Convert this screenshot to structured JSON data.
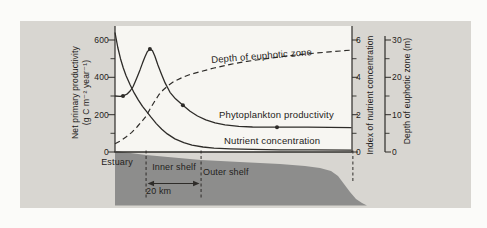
{
  "colors": {
    "paper": "#d8d6d1",
    "plot_bg": "#f7f6f2",
    "ink": "#2e2c29",
    "landmass": "#8d8d8c",
    "page": "#fbfbf9"
  },
  "figure": {
    "left_axis": {
      "title_line1": "Net primary productivity",
      "title_line2": "(g C m⁻² year⁻¹)",
      "ticks": [
        "0",
        "200",
        "400",
        "600"
      ]
    },
    "nutrient_axis": {
      "title": "Index of nutrient concentration",
      "ticks": [
        "0",
        "2",
        "4",
        "6"
      ]
    },
    "depth_axis": {
      "title": "Depth of euphotic zone (m)",
      "ticks": [
        "0",
        "10",
        "20",
        "30"
      ]
    },
    "curve_labels": {
      "depth": "Depth of euphotic zone",
      "phytoplankton": "Phytoplankton productivity",
      "nutrient": "Nutrient concentration"
    },
    "zones": {
      "estuary": "Estuary",
      "inner_shelf": "Inner shelf",
      "outer_shelf": "Outer shelf",
      "scale_bar": "20 km"
    }
  },
  "chart_data": {
    "type": "line",
    "title": "",
    "xlabel": "",
    "x_unit": "km offshore (scale bar = 20 km; zone boundaries marked by dashed lines)",
    "x_range_km": [
      0,
      86.5
    ],
    "axes": {
      "left": {
        "label": "Net primary productivity (g C m⁻² year⁻¹)",
        "range": [
          0,
          620
        ],
        "ticks": [
          0,
          200,
          400,
          600
        ],
        "minor_ticks": [
          100,
          300,
          500
        ]
      },
      "nutrient": {
        "label": "Index of nutrient concentration",
        "range": [
          0,
          6.6
        ],
        "ticks": [
          0,
          2,
          4,
          6
        ],
        "minor_ticks": [
          1,
          3,
          5
        ]
      },
      "depth": {
        "label": "Depth of euphotic zone (m)",
        "range": [
          0,
          32
        ],
        "ticks": [
          0,
          10,
          20,
          30
        ],
        "minor_ticks": [
          5,
          15,
          25
        ]
      }
    },
    "series": [
      {
        "name": "Phytoplankton productivity",
        "axis": "left",
        "style": "solid",
        "points": [
          [
            0,
            300
          ],
          [
            1.8,
            298
          ],
          [
            2.9,
            300
          ],
          [
            4.5,
            312
          ],
          [
            5.5,
            327
          ],
          [
            6.5,
            348
          ],
          [
            7.3,
            375
          ],
          [
            8.2,
            407
          ],
          [
            9.1,
            440
          ],
          [
            10,
            476
          ],
          [
            10.9,
            510
          ],
          [
            11.8,
            538
          ],
          [
            12.7,
            552
          ],
          [
            13.6,
            543
          ],
          [
            14.5,
            513
          ],
          [
            15.6,
            466
          ],
          [
            16.9,
            417
          ],
          [
            18.2,
            370
          ],
          [
            20,
            320
          ],
          [
            22,
            285
          ],
          [
            24.7,
            250
          ],
          [
            27.3,
            218
          ],
          [
            30,
            193
          ],
          [
            33,
            172
          ],
          [
            36.4,
            156
          ],
          [
            40,
            145
          ],
          [
            45,
            137
          ],
          [
            50,
            134
          ],
          [
            58.9,
            133
          ],
          [
            70,
            133
          ],
          [
            86,
            130
          ]
        ],
        "markers": [
          [
            2.9,
            300
          ],
          [
            12.7,
            552
          ],
          [
            24.7,
            250
          ],
          [
            58.9,
            133
          ]
        ]
      },
      {
        "name": "Nutrient concentration",
        "axis": "nutrient",
        "style": "solid",
        "points": [
          [
            0,
            6.4
          ],
          [
            1,
            5.6
          ],
          [
            2,
            5.0
          ],
          [
            3,
            4.5
          ],
          [
            4,
            4.1
          ],
          [
            5.5,
            3.6
          ],
          [
            7,
            3.15
          ],
          [
            8.5,
            2.78
          ],
          [
            10,
            2.45
          ],
          [
            11.3,
            2.2
          ],
          [
            13,
            1.88
          ],
          [
            15,
            1.52
          ],
          [
            17,
            1.22
          ],
          [
            19,
            0.97
          ],
          [
            21.8,
            0.7
          ],
          [
            25,
            0.5
          ],
          [
            28,
            0.37
          ],
          [
            32,
            0.27
          ],
          [
            36,
            0.21
          ],
          [
            42,
            0.17
          ],
          [
            50,
            0.14
          ],
          [
            60,
            0.12
          ],
          [
            72,
            0.11
          ],
          [
            86,
            0.1
          ]
        ],
        "markers": []
      },
      {
        "name": "Depth of euphotic zone",
        "axis": "depth",
        "style": "dashed",
        "points": [
          [
            0,
            2.2
          ],
          [
            2,
            3.0
          ],
          [
            4,
            4.0
          ],
          [
            6,
            5.2
          ],
          [
            8,
            6.7
          ],
          [
            10,
            8.4
          ],
          [
            11.3,
            9.6
          ],
          [
            13,
            11.9
          ],
          [
            14.5,
            13.7
          ],
          [
            16,
            15.4
          ],
          [
            17.5,
            16.6
          ],
          [
            19.5,
            17.9
          ],
          [
            21.5,
            18.9
          ],
          [
            24,
            19.8
          ],
          [
            27,
            20.7
          ],
          [
            31,
            21.5
          ],
          [
            36,
            22.5
          ],
          [
            42,
            23.5
          ],
          [
            48,
            24.3
          ],
          [
            55,
            25.0
          ],
          [
            62,
            25.7
          ],
          [
            70,
            26.3
          ],
          [
            78,
            26.8
          ],
          [
            86,
            27.3
          ]
        ],
        "markers": []
      }
    ],
    "zones": {
      "labels": [
        "Estuary",
        "Inner shelf",
        "Outer shelf"
      ],
      "boundaries_km": [
        11.3,
        31.3
      ],
      "shelf_break_km": 86.5,
      "scale_bar_km": 20,
      "scale_bar_label": "20 km"
    },
    "seafloor_profile_px": [
      [
        115,
        151
      ],
      [
        146,
        155
      ],
      [
        201,
        160
      ],
      [
        240,
        162
      ],
      [
        280,
        164
      ],
      [
        305,
        166
      ],
      [
        320,
        168
      ],
      [
        331,
        171
      ],
      [
        338,
        176
      ],
      [
        344,
        184
      ],
      [
        350,
        192
      ],
      [
        356,
        199
      ],
      [
        362,
        203
      ],
      [
        367,
        205.5
      ],
      [
        115,
        205.5
      ]
    ]
  }
}
